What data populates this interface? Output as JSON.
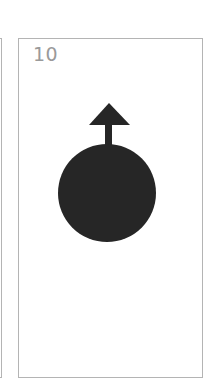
{
  "cards": [
    {
      "position": "left-partial",
      "number": ""
    },
    {
      "position": "main",
      "number": "10",
      "symbol": "circle-with-up-arrow",
      "symbol_color": "#262626"
    }
  ],
  "colors": {
    "border": "#b4b4b4",
    "number": "#9a9a9a",
    "symbol": "#262626",
    "background": "#ffffff"
  }
}
